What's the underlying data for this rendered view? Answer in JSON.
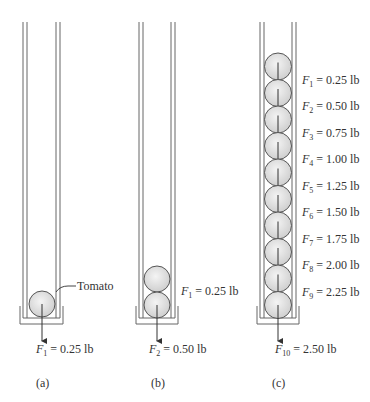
{
  "panels": [
    {
      "id": "a",
      "caption": "(a)",
      "bottom_label": {
        "sym": "F",
        "sub": "1",
        "val": "= 0.25 lb"
      },
      "callout": "Tomato",
      "count": 1
    },
    {
      "id": "b",
      "caption": "(b)",
      "bottom_label": {
        "sym": "F",
        "sub": "2",
        "val": "= 0.50 lb"
      },
      "side_label": {
        "sym": "F",
        "sub": "1",
        "val": "= 0.25 lb"
      },
      "count": 2
    },
    {
      "id": "c",
      "caption": "(c)",
      "bottom_label": {
        "sym": "F",
        "sub": "10",
        "val": "= 2.50 lb"
      },
      "count": 10,
      "side_labels": [
        {
          "sym": "F",
          "sub": "1",
          "val": "= 0.25 lb"
        },
        {
          "sym": "F",
          "sub": "2",
          "val": "= 0.50 lb"
        },
        {
          "sym": "F",
          "sub": "3",
          "val": "= 0.75 lb"
        },
        {
          "sym": "F",
          "sub": "4",
          "val": "= 1.00 lb"
        },
        {
          "sym": "F",
          "sub": "5",
          "val": "= 1.25 lb"
        },
        {
          "sym": "F",
          "sub": "6",
          "val": "= 1.50 lb"
        },
        {
          "sym": "F",
          "sub": "7",
          "val": "= 1.75 lb"
        },
        {
          "sym": "F",
          "sub": "8",
          "val": "= 2.00 lb"
        },
        {
          "sym": "F",
          "sub": "9",
          "val": "= 2.25 lb"
        }
      ]
    }
  ]
}
